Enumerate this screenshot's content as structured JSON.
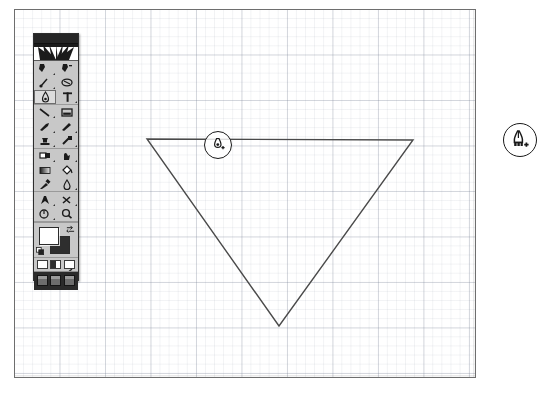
{
  "app": {
    "name": "Adobe Photoshop",
    "document_title": "Untitled-1",
    "canvas_label": "document-canvas",
    "grid_visible": true,
    "background_color": "#ffffff",
    "canvas_border_color": "#6e6e6e",
    "grid_minor_color": "#96a0ac",
    "grid_major_color": "#7882a0",
    "grid_minor_spacing_px": 9,
    "grid_major_spacing_px": 45
  },
  "toolbar": {
    "name": "Tools",
    "titlebar_color": "#262626",
    "panel_color": "#c8c8c8",
    "logo_alt": "photoshop-logo",
    "tools": [
      {
        "id": "marquee",
        "label": "Rectangular Marquee Tool",
        "icon": "marquee-icon",
        "selected": false,
        "has_flyout": true
      },
      {
        "id": "move",
        "label": "Move Tool",
        "icon": "move-arrow-icon",
        "selected": false,
        "has_flyout": false
      },
      {
        "id": "lasso",
        "label": "Lasso Tool",
        "icon": "lasso-icon",
        "selected": false,
        "has_flyout": true
      },
      {
        "id": "magic-wand",
        "label": "Magic Wand Tool",
        "icon": "magic-wand-icon",
        "selected": false,
        "has_flyout": false
      },
      {
        "id": "airbrush",
        "label": "Airbrush Tool",
        "icon": "airbrush-icon",
        "selected": true,
        "has_flyout": false
      },
      {
        "id": "type",
        "label": "Type Tool",
        "icon": "type-t-icon",
        "selected": false,
        "has_flyout": true
      },
      {
        "id": "line",
        "label": "Line Tool",
        "icon": "line-icon",
        "selected": false,
        "has_flyout": true
      },
      {
        "id": "crop",
        "label": "Crop Tool",
        "icon": "crop-icon",
        "selected": false,
        "has_flyout": false
      },
      {
        "id": "paintbrush",
        "label": "Paintbrush Tool",
        "icon": "paintbrush-icon",
        "selected": false,
        "has_flyout": true
      },
      {
        "id": "pencil",
        "label": "Pencil Tool",
        "icon": "pencil-icon",
        "selected": false,
        "has_flyout": true
      },
      {
        "id": "rubber-stamp",
        "label": "Rubber Stamp Tool",
        "icon": "rubber-stamp-icon",
        "selected": false,
        "has_flyout": true
      },
      {
        "id": "history-brush",
        "label": "History Brush Tool",
        "icon": "history-brush-icon",
        "selected": false,
        "has_flyout": true
      },
      {
        "id": "eraser",
        "label": "Eraser Tool",
        "icon": "eraser-icon",
        "selected": false,
        "has_flyout": true
      },
      {
        "id": "smudge",
        "label": "Smudge Tool",
        "icon": "smudge-finger-icon",
        "selected": false,
        "has_flyout": true
      },
      {
        "id": "gradient",
        "label": "Gradient Tool",
        "icon": "gradient-icon",
        "selected": false,
        "has_flyout": true
      },
      {
        "id": "paint-bucket",
        "label": "Paint Bucket Tool",
        "icon": "paint-bucket-icon",
        "selected": false,
        "has_flyout": true
      },
      {
        "id": "eyedropper",
        "label": "Eyedropper Tool",
        "icon": "eyedropper-icon",
        "selected": false,
        "has_flyout": true
      },
      {
        "id": "blur",
        "label": "Blur Tool",
        "icon": "blur-drop-icon",
        "selected": false,
        "has_flyout": true
      },
      {
        "id": "pen",
        "label": "Pen Tool",
        "icon": "pen-nib-icon",
        "selected": false,
        "has_flyout": true
      },
      {
        "id": "dodge-burn",
        "label": "Dodge / Burn Tool",
        "icon": "dodge-burn-icon",
        "selected": false,
        "has_flyout": true
      },
      {
        "id": "measure",
        "label": "Measure Tool",
        "icon": "measure-icon",
        "selected": false,
        "has_flyout": true
      },
      {
        "id": "zoom",
        "label": "Zoom Tool",
        "icon": "magnifier-icon",
        "selected": false,
        "has_flyout": false
      },
      {
        "id": "hand",
        "label": "Hand Tool",
        "icon": "hand-icon",
        "selected": false,
        "has_flyout": false
      },
      {
        "id": "direct-select",
        "label": "Direct Selection Tool",
        "icon": "direct-select-icon",
        "selected": false,
        "has_flyout": false
      }
    ],
    "colors": {
      "foreground": "#ffffff",
      "background": "#2e2e2e",
      "foreground_label": "Set foreground color",
      "background_label": "Set background color",
      "swap_label": "Switch foreground and background colors",
      "default_label": "Default foreground and background colors"
    },
    "mask_modes": [
      {
        "id": "standard-mode",
        "label": "Edit in standard mode",
        "selected": true
      },
      {
        "id": "quick-mask-mode",
        "label": "Edit in quick mask mode",
        "selected": false
      },
      {
        "id": "quick-mask-alt",
        "label": "Quick mask options",
        "selected": false
      }
    ],
    "screen_modes": [
      {
        "id": "standard-screen",
        "label": "Standard screen mode",
        "selected": true
      },
      {
        "id": "full-screen-menu",
        "label": "Full screen mode with menu bar",
        "selected": false
      },
      {
        "id": "full-screen",
        "label": "Full screen mode",
        "selected": false
      }
    ]
  },
  "shape": {
    "name": "inverted-triangle-path",
    "stroke_color": "#4a4a4a",
    "stroke_width": 1.4,
    "fill": "none",
    "points": "146,138 412,139 278,325",
    "vertices": [
      {
        "label": "top-left-anchor",
        "x": 146,
        "y": 138
      },
      {
        "label": "top-right-anchor",
        "x": 412,
        "y": 139
      },
      {
        "label": "bottom-anchor",
        "x": 278,
        "y": 325
      }
    ]
  },
  "cursors": {
    "inline": {
      "name": "add-anchor-point-cursor",
      "label": "Add Anchor Point",
      "x": 218,
      "y": 145
    },
    "callout": {
      "name": "add-anchor-point-cursor-callout",
      "label": "Add Anchor Point",
      "x": 520,
      "y": 140
    }
  }
}
